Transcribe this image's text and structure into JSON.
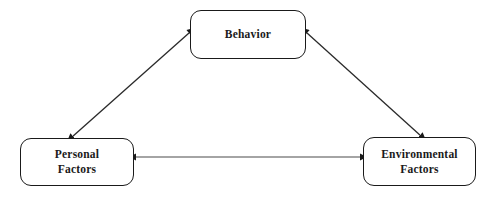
{
  "diagram": {
    "type": "triadic-reciprocal-determinism",
    "background_color": "#ffffff",
    "stroke_color": "#1a1a1a",
    "text_color": "#1a1a1a",
    "nodes": [
      {
        "id": "behavior",
        "label": "Behavior",
        "x": 190,
        "y": 10,
        "width": 116,
        "height": 49
      },
      {
        "id": "personal",
        "label": "Personal\nFactors",
        "x": 20,
        "y": 138,
        "width": 114,
        "height": 48
      },
      {
        "id": "environmental",
        "label": "Environmental\nFactors",
        "x": 363,
        "y": 137,
        "width": 113,
        "height": 49
      }
    ],
    "connectors": [
      {
        "id": "behavior-personal",
        "from": "behavior",
        "to": "personal",
        "direction": "bidirectional",
        "x1": 189,
        "y1": 33,
        "x2": 72,
        "y2": 137
      },
      {
        "id": "behavior-environmental",
        "from": "behavior",
        "to": "environmental",
        "direction": "bidirectional",
        "x1": 307,
        "y1": 33,
        "x2": 421,
        "y2": 136
      },
      {
        "id": "personal-environmental",
        "from": "personal",
        "to": "environmental",
        "direction": "bidirectional",
        "x1": 135,
        "y1": 157,
        "x2": 362,
        "y2": 157
      }
    ]
  }
}
